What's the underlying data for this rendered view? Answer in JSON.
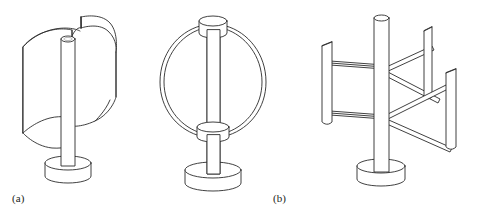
{
  "figure": {
    "background_color": "#ffffff",
    "line_color": "#2b2b2b",
    "width": 486,
    "height": 218
  },
  "panels": [
    {
      "id": "a",
      "caption": "(a)",
      "name": "savonius-rotor",
      "description": "Savonius rotor: two S-shaped / C-shaped curved scoop blades mounted on a central vertical shaft with a cylindrical disc base",
      "parts": [
        "curved-blade-left",
        "curved-blade-right",
        "vertical-shaft",
        "shaft-top-cap",
        "base-disc"
      ]
    },
    {
      "id": "b",
      "caption": "(b)",
      "name": "darrieus-rotor",
      "description": "Darrieus eggbeater rotor: two troposkein curved blades bowing outward from a top hub to a bottom hub on a vertical shaft with a cylindrical disc base",
      "parts": [
        "curved-blade-left",
        "curved-blade-right",
        "top-hub",
        "bottom-hub",
        "vertical-shaft",
        "base-disc"
      ]
    },
    {
      "id": "c",
      "caption": "(c)",
      "name": "h-rotor-giromill",
      "description": "H-rotor (Giromill): three straight vertical aerofoil blades held by horizontal support struts radiating from a central vertical shaft with a cylindrical disc base",
      "parts": [
        "straight-blade-left",
        "straight-blade-upper-right",
        "straight-blade-lower-right",
        "support-struts",
        "vertical-shaft",
        "base-disc"
      ]
    }
  ]
}
